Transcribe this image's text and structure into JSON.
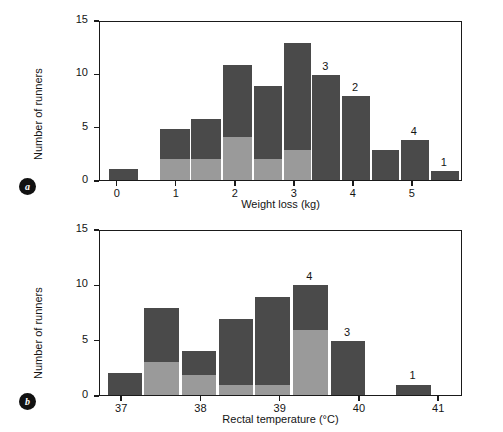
{
  "figure": {
    "background_color": "#ffffff",
    "bar_dark_color": "#4a4a4a",
    "bar_light_color": "#9a9a9a",
    "axis_color": "#1a1a1a"
  },
  "panels": [
    {
      "badge": "a",
      "ylabel": "Number of runners",
      "xlabel": "Weight loss (kg)"
    },
    {
      "badge": "b",
      "ylabel": "Number of runners",
      "xlabel": "Rectal temperature (°C)"
    }
  ],
  "chart_data": [
    {
      "type": "bar",
      "id": "panel-a-weight-loss",
      "title": "",
      "xlabel": "Weight loss (kg)",
      "ylabel": "Number of runners",
      "xlim": [
        -0.3,
        5.85
      ],
      "ylim": [
        0,
        15
      ],
      "xticks": [
        0,
        1,
        2,
        3,
        4,
        5
      ],
      "xtick_labels": [
        "0",
        "1",
        "2",
        "3",
        "4",
        "5"
      ],
      "yticks": [
        0,
        5,
        10,
        15
      ],
      "ytick_labels": [
        "0",
        "5",
        "10",
        "15"
      ],
      "grid": false,
      "legend": "none",
      "bin_width": 0.5,
      "stacked": true,
      "series": [
        {
          "name": "lower-segment",
          "color": "#9a9a9a"
        },
        {
          "name": "upper-segment",
          "color": "#4a4a4a"
        }
      ],
      "bins": [
        {
          "x0": -0.15,
          "x1": 0.35,
          "light": 0,
          "dark": 1,
          "total": 1,
          "note": ""
        },
        {
          "x0": 0.35,
          "x1": 0.72,
          "light": 0,
          "dark": 0,
          "total": 0,
          "note": ""
        },
        {
          "x0": 0.72,
          "x1": 1.22,
          "light": 2,
          "dark": 2.75,
          "total": 4.75,
          "note": ""
        },
        {
          "x0": 1.25,
          "x1": 1.75,
          "light": 2,
          "dark": 3.75,
          "total": 5.75,
          "note": ""
        },
        {
          "x0": 1.78,
          "x1": 2.28,
          "light": 4,
          "dark": 6.75,
          "total": 10.75,
          "note": ""
        },
        {
          "x0": 2.31,
          "x1": 2.78,
          "light": 2,
          "dark": 6.8,
          "total": 8.8,
          "note": ""
        },
        {
          "x0": 2.81,
          "x1": 3.28,
          "light": 2.8,
          "dark": 10,
          "total": 12.8,
          "note": ""
        },
        {
          "x0": 3.3,
          "x1": 3.77,
          "light": 0,
          "dark": 9.85,
          "total": 9.85,
          "note": "3"
        },
        {
          "x0": 3.8,
          "x1": 4.28,
          "light": 0,
          "dark": 7.85,
          "total": 7.85,
          "note": "2"
        },
        {
          "x0": 4.3,
          "x1": 4.77,
          "light": 0,
          "dark": 2.85,
          "total": 2.85,
          "note": ""
        },
        {
          "x0": 4.8,
          "x1": 5.27,
          "light": 0,
          "dark": 3.75,
          "total": 3.75,
          "note": "4"
        },
        {
          "x0": 5.3,
          "x1": 5.78,
          "light": 0,
          "dark": 0.85,
          "total": 0.85,
          "note": "1"
        }
      ],
      "annotations": [
        {
          "label": "3",
          "bin_index": 7
        },
        {
          "label": "2",
          "bin_index": 8
        },
        {
          "label": "4",
          "bin_index": 10
        },
        {
          "label": "1",
          "bin_index": 11
        }
      ]
    },
    {
      "type": "bar",
      "id": "panel-b-rectal-temperature",
      "title": "",
      "xlabel": "Rectal temperature (°C)",
      "ylabel": "Number of runners",
      "xlim": [
        36.72,
        41.3
      ],
      "ylim": [
        0,
        15
      ],
      "xticks": [
        37,
        38,
        39,
        40,
        41
      ],
      "xtick_labels": [
        "37",
        "38",
        "39",
        "40",
        "41"
      ],
      "yticks": [
        0,
        5,
        10,
        15
      ],
      "ytick_labels": [
        "0",
        "5",
        "10",
        "15"
      ],
      "grid": false,
      "legend": "none",
      "bin_width": 0.42,
      "stacked": true,
      "series": [
        {
          "name": "lower-segment",
          "color": "#9a9a9a"
        },
        {
          "name": "upper-segment",
          "color": "#4a4a4a"
        }
      ],
      "bins": [
        {
          "x0": 36.82,
          "x1": 37.25,
          "light": 0,
          "dark": 2,
          "total": 2,
          "note": ""
        },
        {
          "x0": 37.28,
          "x1": 37.72,
          "light": 3,
          "dark": 4.85,
          "total": 7.85,
          "note": ""
        },
        {
          "x0": 37.75,
          "x1": 38.18,
          "light": 1.85,
          "dark": 2.1,
          "total": 3.95,
          "note": ""
        },
        {
          "x0": 38.22,
          "x1": 38.65,
          "light": 0.9,
          "dark": 5.95,
          "total": 6.85,
          "note": ""
        },
        {
          "x0": 38.68,
          "x1": 39.12,
          "light": 0.95,
          "dark": 7.95,
          "total": 8.9,
          "note": ""
        },
        {
          "x0": 39.15,
          "x1": 39.6,
          "light": 5.9,
          "dark": 4,
          "total": 9.9,
          "note": "4"
        },
        {
          "x0": 39.63,
          "x1": 40.07,
          "light": 0,
          "dark": 4.9,
          "total": 4.9,
          "note": "3"
        },
        {
          "x0": 40.45,
          "x1": 40.9,
          "light": 0,
          "dark": 0.95,
          "total": 0.95,
          "note": "1"
        }
      ],
      "annotations": [
        {
          "label": "4",
          "bin_index": 5
        },
        {
          "label": "3",
          "bin_index": 6
        },
        {
          "label": "1",
          "bin_index": 7
        }
      ]
    }
  ]
}
